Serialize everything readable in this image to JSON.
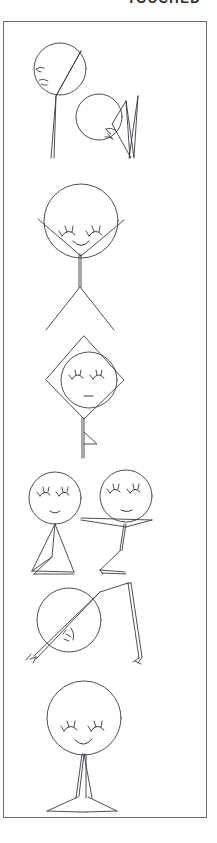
{
  "page": {
    "title_partial": "TOUCHED",
    "background_color": "#ffffff",
    "ink_color": "#3a3a42",
    "frame_color": "#6b6b70"
  },
  "frame": {
    "x": 3,
    "y": 21,
    "width": 204,
    "height": 797
  },
  "drawing": {
    "medium": "pen-line-drawing",
    "style": "hand-drawn stick figures",
    "figure_count": 7,
    "panels": [
      {
        "index": 1,
        "name": "two-tilted-heads-with-long-strokes",
        "description": "Two circular heads, upper-left head crossed by a long diagonal stroke running past it, lower-right head beside a narrow elongated triangle wedge; sketchy eye and mouth marks on the left of each head."
      },
      {
        "index": 2,
        "name": "smiling-stick-figure-arms-up",
        "description": "Round head with two closed lash eyes and a smile, V-shaped raised arms, straight torso, legs spread in an inverted V."
      },
      {
        "index": 3,
        "name": "head-in-diamond-kite",
        "description": "Round head with closed eyes and straight mouth enclosed in a diamond/kite outline, with a vertical tail line and a small triangular flag."
      },
      {
        "index": 4,
        "name": "pair-of-figures-triangular-bodies",
        "description": "Two heads side by side with closed lash eyes and small mouths; left figure has a triangular skirt body with bent leg, right figure has long horizontal outstretched arms and a bent leg."
      },
      {
        "index": 5,
        "name": "tilted-head-with-long-limb",
        "description": "Circle head crossed by a long diagonal line with small fork marks, a long doubled limb rising to the upper right then bending down to a forked foot."
      },
      {
        "index": 6,
        "name": "smiling-figure-on-tripod-base",
        "description": "Round head with closed lash eyes and a smile over a narrow tapering body resting on a wide triangular base."
      }
    ]
  }
}
